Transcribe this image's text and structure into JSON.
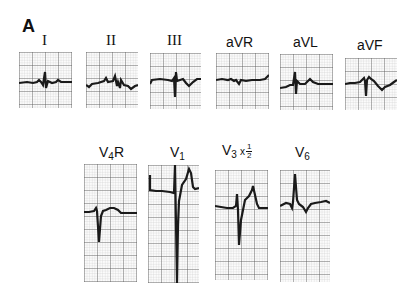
{
  "figure": {
    "panel_letter": "A",
    "colors": {
      "trace": "#1a1a1a",
      "grid_major": "#555555",
      "grid_minor": "#bdbdbd",
      "background": "#ffffff"
    }
  },
  "limb_leads": [
    {
      "id": "I",
      "label": "I",
      "box": [
        19,
        52,
        53,
        56
      ]
    },
    {
      "id": "II",
      "label": "II",
      "box": [
        86,
        52,
        52,
        56
      ]
    },
    {
      "id": "III",
      "label": "III",
      "box": [
        150,
        53,
        51,
        56
      ]
    },
    {
      "id": "aVR",
      "label": "aVR",
      "box": [
        216,
        53,
        53,
        56
      ]
    },
    {
      "id": "aVL",
      "label": "aVL",
      "box": [
        280,
        54,
        53,
        56
      ]
    },
    {
      "id": "aVF",
      "label": "aVF",
      "box": [
        345,
        58,
        52,
        52
      ]
    }
  ],
  "precordial_leads": [
    {
      "id": "V4R",
      "label_main": "V",
      "label_sub": "4",
      "label_suffix": "R",
      "box": [
        84,
        164,
        53,
        118
      ]
    },
    {
      "id": "V1",
      "label_main": "V",
      "label_sub": "1",
      "label_suffix": "",
      "box": [
        148,
        165,
        51,
        118
      ]
    },
    {
      "id": "V3",
      "label_main": "V",
      "label_sub": "3",
      "label_suffix": "x",
      "scale_num": "1",
      "scale_den": "2",
      "box": [
        215,
        170,
        53,
        110
      ]
    },
    {
      "id": "V6",
      "label_main": "V",
      "label_sub": "6",
      "label_suffix": "",
      "box": [
        280,
        170,
        50,
        112
      ]
    }
  ]
}
